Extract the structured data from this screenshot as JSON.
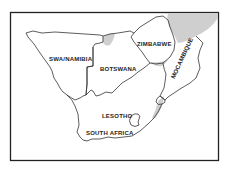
{
  "map": {
    "title": "",
    "colors": {
      "frame": "#222222",
      "border": "#333333",
      "shading": "#cfcfcf",
      "background": "#ffffff"
    },
    "labels": {
      "swa_namibia": "SWA/NAMIBIA",
      "botswana": "BOTSWANA",
      "zimbabwe": "ZIMBABWE",
      "mocambique": "MOCAMBIQUE",
      "lesotho": "LESOTHO",
      "south_africa": "SOUTH AFRICA"
    }
  }
}
